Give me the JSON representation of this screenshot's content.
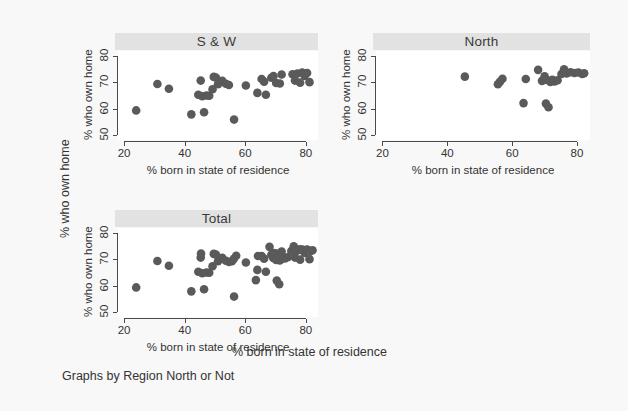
{
  "figure": {
    "outer_ylabel": "% who own home",
    "outer_xlabel": "% born in state of residence",
    "note": "Graphs by Region North or Not",
    "background": "#f8f8f8",
    "marker_color": "#5a5a5a",
    "title_bar_color": "#e2e2e2"
  },
  "chart_data": {
    "type": "scatter",
    "title": "",
    "xlabel": "% born in state of residence",
    "ylabel": "% who own home",
    "xlim": [
      18,
      84
    ],
    "ylim": [
      48,
      82
    ],
    "xticks": [
      20,
      40,
      60,
      80
    ],
    "yticks": [
      50,
      60,
      70,
      80
    ],
    "grid": false,
    "legend": "none",
    "panels": [
      {
        "name": "S & W",
        "title": "S & W",
        "xlabel": "% born in state of residence",
        "ylabel": "% who own home",
        "xticks": [
          20,
          40,
          60,
          80
        ],
        "yticks": [
          50,
          60,
          70,
          80
        ],
        "points": [
          [
            24.0,
            59.3
          ],
          [
            31.0,
            69.4
          ],
          [
            34.8,
            67.6
          ],
          [
            42.2,
            57.8
          ],
          [
            44.5,
            65.3
          ],
          [
            45.3,
            70.7
          ],
          [
            45.8,
            64.7
          ],
          [
            46.4,
            58.6
          ],
          [
            47.2,
            65.0
          ],
          [
            48.1,
            64.9
          ],
          [
            49.2,
            67.4
          ],
          [
            49.6,
            72.1
          ],
          [
            50.3,
            71.9
          ],
          [
            51.0,
            69.3
          ],
          [
            52.4,
            70.6
          ],
          [
            53.6,
            69.5
          ],
          [
            54.6,
            69.0
          ],
          [
            56.3,
            55.8
          ],
          [
            60.2,
            68.8
          ],
          [
            64.0,
            66.0
          ],
          [
            65.4,
            71.3
          ],
          [
            66.2,
            70.3
          ],
          [
            66.8,
            65.3
          ],
          [
            68.6,
            71.8
          ],
          [
            69.3,
            72.4
          ],
          [
            70.2,
            69.8
          ],
          [
            71.4,
            69.6
          ],
          [
            72.0,
            73.0
          ],
          [
            75.6,
            73.1
          ],
          [
            76.4,
            70.7
          ],
          [
            77.2,
            73.4
          ],
          [
            78.1,
            69.9
          ],
          [
            78.8,
            73.8
          ],
          [
            79.6,
            72.5
          ],
          [
            80.4,
            73.6
          ],
          [
            81.2,
            70.1
          ]
        ]
      },
      {
        "name": "North",
        "title": "North",
        "xlabel": "% born in state of residence",
        "ylabel": "% who own home",
        "xticks": [
          20,
          40,
          60,
          80
        ],
        "yticks": [
          50,
          60,
          70,
          80
        ],
        "points": [
          [
            45.4,
            72.2
          ],
          [
            55.6,
            69.3
          ],
          [
            56.2,
            70.2
          ],
          [
            57.0,
            71.4
          ],
          [
            63.5,
            62.1
          ],
          [
            64.2,
            71.3
          ],
          [
            68.0,
            74.8
          ],
          [
            69.2,
            70.6
          ],
          [
            70.0,
            72.3
          ],
          [
            70.4,
            61.9
          ],
          [
            70.8,
            70.9
          ],
          [
            71.2,
            60.5
          ],
          [
            71.8,
            70.2
          ],
          [
            72.4,
            71.0
          ],
          [
            73.1,
            70.4
          ],
          [
            74.0,
            70.8
          ],
          [
            75.2,
            73.2
          ],
          [
            76.0,
            75.0
          ],
          [
            76.8,
            73.4
          ],
          [
            78.0,
            73.9
          ],
          [
            79.2,
            73.6
          ],
          [
            80.4,
            73.8
          ],
          [
            81.6,
            73.2
          ],
          [
            82.2,
            73.5
          ]
        ]
      },
      {
        "name": "Total",
        "title": "Total",
        "xlabel": "% born in state of residence",
        "ylabel": "% who own home",
        "xticks": [
          20,
          40,
          60,
          80
        ],
        "yticks": [
          50,
          60,
          70,
          80
        ],
        "points": [
          [
            24.0,
            59.3
          ],
          [
            31.0,
            69.4
          ],
          [
            34.8,
            67.6
          ],
          [
            42.2,
            57.8
          ],
          [
            44.5,
            65.3
          ],
          [
            45.3,
            70.7
          ],
          [
            45.8,
            64.7
          ],
          [
            46.4,
            58.6
          ],
          [
            47.2,
            65.0
          ],
          [
            48.1,
            64.9
          ],
          [
            49.2,
            67.4
          ],
          [
            49.6,
            72.1
          ],
          [
            50.3,
            71.9
          ],
          [
            51.0,
            69.3
          ],
          [
            52.4,
            70.6
          ],
          [
            53.6,
            69.5
          ],
          [
            54.6,
            69.0
          ],
          [
            56.3,
            55.8
          ],
          [
            60.2,
            68.8
          ],
          [
            64.0,
            66.0
          ],
          [
            65.4,
            71.3
          ],
          [
            66.2,
            70.3
          ],
          [
            66.8,
            65.3
          ],
          [
            68.6,
            71.8
          ],
          [
            69.3,
            72.4
          ],
          [
            70.2,
            69.8
          ],
          [
            71.4,
            69.6
          ],
          [
            72.0,
            73.0
          ],
          [
            75.6,
            73.1
          ],
          [
            76.4,
            70.7
          ],
          [
            77.2,
            73.4
          ],
          [
            78.1,
            69.9
          ],
          [
            78.8,
            73.8
          ],
          [
            79.6,
            72.5
          ],
          [
            80.4,
            73.6
          ],
          [
            81.2,
            70.1
          ],
          [
            45.4,
            72.2
          ],
          [
            55.6,
            69.3
          ],
          [
            56.2,
            70.2
          ],
          [
            57.0,
            71.4
          ],
          [
            63.5,
            62.1
          ],
          [
            64.2,
            71.3
          ],
          [
            68.0,
            74.8
          ],
          [
            69.2,
            70.6
          ],
          [
            70.0,
            72.3
          ],
          [
            70.4,
            61.9
          ],
          [
            70.8,
            70.9
          ],
          [
            71.2,
            60.5
          ],
          [
            71.8,
            70.2
          ],
          [
            72.4,
            71.0
          ],
          [
            73.1,
            70.4
          ],
          [
            74.0,
            70.8
          ],
          [
            75.2,
            73.2
          ],
          [
            76.0,
            75.0
          ],
          [
            76.8,
            73.4
          ],
          [
            78.0,
            73.9
          ],
          [
            79.2,
            73.6
          ],
          [
            80.4,
            73.8
          ],
          [
            81.6,
            73.2
          ],
          [
            82.2,
            73.5
          ]
        ]
      }
    ]
  }
}
